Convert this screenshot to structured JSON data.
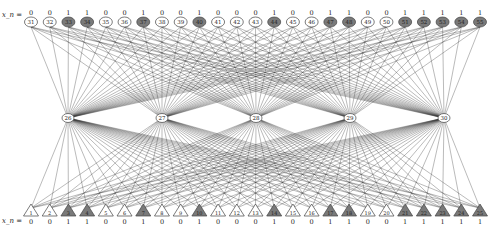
{
  "diagram": {
    "top_row_label": "x_n = ",
    "bottom_row_label": "x_n = ",
    "colors": {
      "edge": "#333333",
      "node_fill_zero": "#ffffff",
      "node_fill_one": "#7a7a7a",
      "node_stroke": "#444444",
      "text": "#222222"
    },
    "top_nodes": [
      {
        "id": "31",
        "value": "0"
      },
      {
        "id": "32",
        "value": "0"
      },
      {
        "id": "33",
        "value": "1"
      },
      {
        "id": "34",
        "value": "1"
      },
      {
        "id": "35",
        "value": "0"
      },
      {
        "id": "36",
        "value": "0"
      },
      {
        "id": "37",
        "value": "1"
      },
      {
        "id": "38",
        "value": "0"
      },
      {
        "id": "39",
        "value": "0"
      },
      {
        "id": "40",
        "value": "1"
      },
      {
        "id": "41",
        "value": "0"
      },
      {
        "id": "42",
        "value": "0"
      },
      {
        "id": "43",
        "value": "0"
      },
      {
        "id": "44",
        "value": "1"
      },
      {
        "id": "45",
        "value": "0"
      },
      {
        "id": "46",
        "value": "0"
      },
      {
        "id": "47",
        "value": "1"
      },
      {
        "id": "48",
        "value": "1"
      },
      {
        "id": "49",
        "value": "0"
      },
      {
        "id": "50",
        "value": "0"
      },
      {
        "id": "51",
        "value": "1"
      },
      {
        "id": "52",
        "value": "1"
      },
      {
        "id": "53",
        "value": "1"
      },
      {
        "id": "54",
        "value": "1"
      },
      {
        "id": "55",
        "value": "1"
      }
    ],
    "middle_nodes": [
      {
        "id": "26"
      },
      {
        "id": "27"
      },
      {
        "id": "28"
      },
      {
        "id": "29"
      },
      {
        "id": "30"
      }
    ],
    "bottom_nodes": [
      {
        "id": "1",
        "value": "0"
      },
      {
        "id": "2",
        "value": "0"
      },
      {
        "id": "3",
        "value": "1"
      },
      {
        "id": "4",
        "value": "1"
      },
      {
        "id": "5",
        "value": "0"
      },
      {
        "id": "6",
        "value": "0"
      },
      {
        "id": "7",
        "value": "1"
      },
      {
        "id": "8",
        "value": "0"
      },
      {
        "id": "9",
        "value": "0"
      },
      {
        "id": "10",
        "value": "1"
      },
      {
        "id": "11",
        "value": "0"
      },
      {
        "id": "12",
        "value": "0"
      },
      {
        "id": "13",
        "value": "0"
      },
      {
        "id": "14",
        "value": "1"
      },
      {
        "id": "15",
        "value": "0"
      },
      {
        "id": "16",
        "value": "0"
      },
      {
        "id": "17",
        "value": "1"
      },
      {
        "id": "18",
        "value": "1"
      },
      {
        "id": "19",
        "value": "0"
      },
      {
        "id": "20",
        "value": "0"
      },
      {
        "id": "21",
        "value": "1"
      },
      {
        "id": "22",
        "value": "1"
      },
      {
        "id": "23",
        "value": "1"
      },
      {
        "id": "24",
        "value": "1"
      },
      {
        "id": "25",
        "value": "1"
      }
    ]
  }
}
